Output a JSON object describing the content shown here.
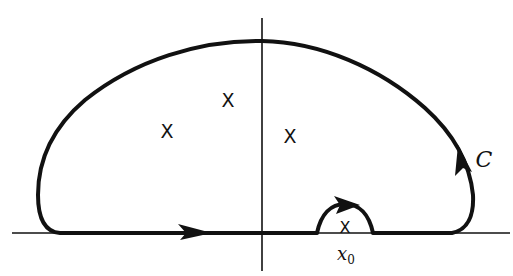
{
  "diagram": {
    "title": "",
    "contour": {
      "label": "C",
      "label_pos": [
        484,
        159
      ],
      "color": "#111111",
      "direction": "counterclockwise"
    },
    "axes": {
      "real_axis": {
        "y": 233,
        "x_start": 12,
        "x_end": 510
      },
      "imag_axis": {
        "x": 262,
        "y_start": 18,
        "y_end": 271
      }
    },
    "poles": [
      {
        "symbol": "X",
        "x": 228,
        "y": 100
      },
      {
        "symbol": "X",
        "x": 167,
        "y": 131
      },
      {
        "symbol": "X",
        "x": 290,
        "y": 136
      }
    ],
    "point_on_axis": {
      "symbol": "X",
      "x": 345,
      "y": 233,
      "label_main": "x",
      "label_sub": "0",
      "label_pos": [
        346,
        255
      ]
    },
    "indentation": {
      "description": "small semicircular detour above x0",
      "center_x": 345,
      "radius": 28
    }
  }
}
